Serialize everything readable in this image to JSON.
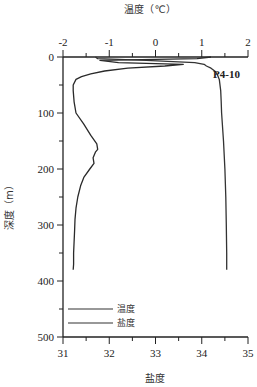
{
  "chart_data": {
    "type": "line",
    "title": "",
    "station_label": "P4-10",
    "top_axis": {
      "label": "温度（℃）",
      "range": [
        -2,
        2
      ],
      "ticks": [
        "-2",
        "-1",
        "0",
        "1",
        "2"
      ]
    },
    "bottom_axis": {
      "label": "盐度",
      "range": [
        31,
        35
      ],
      "ticks": [
        "31",
        "32",
        "33",
        "34",
        "35"
      ]
    },
    "y_axis": {
      "label": "深度（m）",
      "range": [
        0,
        500
      ],
      "inverted": true,
      "ticks": [
        "0",
        "100",
        "200",
        "300",
        "400",
        "500"
      ]
    },
    "legend": [
      {
        "name": "温度"
      },
      {
        "name": "盐度"
      }
    ],
    "series": [
      {
        "name": "温度",
        "axis": "top",
        "depth": [
          0,
          3,
          6,
          10,
          13,
          16,
          20,
          25,
          30,
          35,
          40,
          50,
          60,
          80,
          100,
          120,
          140,
          155,
          165,
          170,
          180,
          190,
          200,
          215,
          230,
          250,
          270,
          290,
          310,
          330,
          350,
          370,
          380
        ],
        "values": [
          1.2,
          0.9,
          -1.2,
          -0.8,
          0.6,
          0.2,
          -0.6,
          -1.1,
          -1.4,
          -1.6,
          -1.72,
          -1.78,
          -1.78,
          -1.76,
          -1.72,
          -1.55,
          -1.4,
          -1.27,
          -1.25,
          -1.3,
          -1.35,
          -1.33,
          -1.42,
          -1.55,
          -1.62,
          -1.68,
          -1.72,
          -1.74,
          -1.75,
          -1.76,
          -1.77,
          -1.77,
          -1.78
        ]
      },
      {
        "name": "盐度",
        "axis": "bottom",
        "depth": [
          0,
          3,
          6,
          10,
          13,
          16,
          20,
          25,
          30,
          40,
          60,
          80,
          100,
          150,
          200,
          250,
          300,
          350,
          380
        ],
        "values": [
          31.7,
          31.75,
          32.8,
          33.85,
          34.05,
          34.1,
          34.2,
          34.28,
          34.33,
          34.38,
          34.41,
          34.42,
          34.43,
          34.47,
          34.5,
          34.52,
          34.53,
          34.54,
          34.54
        ]
      }
    ]
  }
}
